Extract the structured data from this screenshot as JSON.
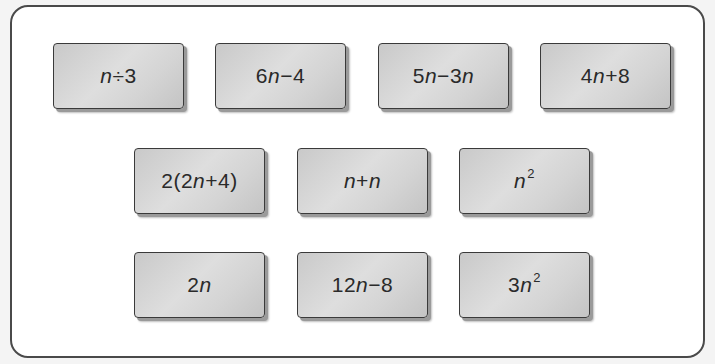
{
  "cards": [
    {
      "id": "card-1",
      "expression": "n÷3",
      "row": 1,
      "col": 1
    },
    {
      "id": "card-2",
      "expression": "6n−4",
      "row": 1,
      "col": 2
    },
    {
      "id": "card-3",
      "expression": "5n−3n",
      "row": 1,
      "col": 3
    },
    {
      "id": "card-4",
      "expression": "4n+8",
      "row": 1,
      "col": 4
    },
    {
      "id": "card-5",
      "expression": "2(2n+4)",
      "row": 2,
      "col": 1
    },
    {
      "id": "card-6",
      "expression": "n+n",
      "row": 2,
      "col": 2
    },
    {
      "id": "card-7",
      "expression": "n²",
      "row": 2,
      "col": 3
    },
    {
      "id": "card-8",
      "expression": "2n",
      "row": 3,
      "col": 1
    },
    {
      "id": "card-9",
      "expression": "12n−8",
      "row": 3,
      "col": 2
    },
    {
      "id": "card-10",
      "expression": "3n²",
      "row": 3,
      "col": 3
    }
  ],
  "colors": {
    "card_fill": "#d4d4d4",
    "card_border": "#3a3a3a",
    "frame_border": "#4a4a4a",
    "text": "#2a2a2a"
  }
}
